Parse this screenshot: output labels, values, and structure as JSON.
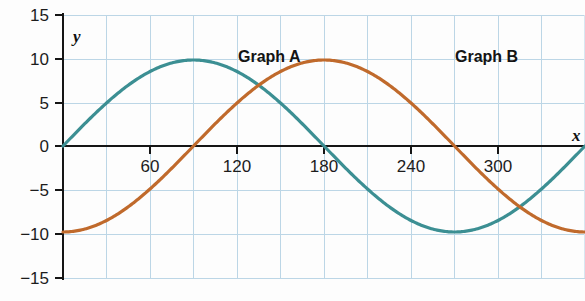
{
  "chart_data": {
    "type": "line",
    "title": "",
    "xlabel": "x",
    "ylabel": "y",
    "xlim": [
      -30,
      390
    ],
    "ylim": [
      -15,
      15
    ],
    "x_ticks": [
      60,
      120,
      180,
      240,
      300
    ],
    "x_tick_labels": [
      "60",
      "120",
      "180",
      "240",
      "300"
    ],
    "y_ticks": [
      15,
      10,
      5,
      0,
      -5,
      -10,
      -15
    ],
    "y_tick_labels": [
      "15",
      "10",
      "5",
      "0",
      "−5",
      "−10",
      "−15"
    ],
    "grid": true,
    "grid_x_step": 30,
    "grid_y_step": 5,
    "legend": "inline-annotations",
    "annotations": [
      {
        "text": "Graph A",
        "x": 145,
        "y": 11.5
      },
      {
        "text": "Graph B",
        "x": 295,
        "y": 11.5
      }
    ],
    "series": [
      {
        "name": "Graph A",
        "color": "#3c8f93",
        "equation": "y = 10 sin(x)",
        "amplitude": 10,
        "period": 360,
        "phase_deg": 0,
        "x": [
          0,
          15,
          30,
          45,
          60,
          75,
          90,
          105,
          120,
          135,
          150,
          165,
          180,
          195,
          210,
          225,
          240,
          255,
          270,
          285,
          300,
          315,
          330,
          345,
          360,
          375,
          390
        ],
        "values": [
          0,
          2.59,
          5,
          7.07,
          8.66,
          9.66,
          10,
          9.66,
          8.66,
          7.07,
          5,
          2.59,
          0,
          -2.59,
          -5,
          -7.07,
          -8.66,
          -9.66,
          -10,
          -9.66,
          -8.66,
          -7.07,
          -5,
          -2.59,
          0,
          2.59,
          5
        ]
      },
      {
        "name": "Graph B",
        "color": "#c06a2c",
        "equation": "y = 10 cos(x)",
        "amplitude": 10,
        "period": 360,
        "phase_deg": 90,
        "x": [
          0,
          15,
          30,
          45,
          60,
          75,
          90,
          105,
          120,
          135,
          150,
          165,
          180,
          195,
          210,
          225,
          240,
          255,
          270,
          285,
          300,
          315,
          330,
          345,
          360,
          375,
          390
        ],
        "values": [
          10,
          9.66,
          8.66,
          7.07,
          5,
          2.59,
          0,
          -2.59,
          -5,
          -7.07,
          -8.66,
          -9.66,
          -10,
          -9.66,
          -8.66,
          -7.07,
          -5,
          -2.59,
          0,
          2.59,
          5,
          7.07,
          8.66,
          9.66,
          10,
          9.66,
          8.66
        ]
      }
    ]
  },
  "axes": {
    "y_axis_label": "y",
    "x_axis_label": "x"
  }
}
